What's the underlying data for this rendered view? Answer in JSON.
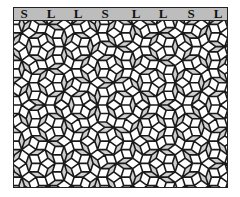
{
  "figure": {
    "type": "penrose-rhombus-tiling",
    "header": {
      "sequence": [
        {
          "letter": "S",
          "x": 10
        },
        {
          "letter": "L",
          "x": 37
        },
        {
          "letter": "L",
          "x": 64
        },
        {
          "letter": "S",
          "x": 91
        },
        {
          "letter": "L",
          "x": 122
        },
        {
          "letter": "L",
          "x": 149
        },
        {
          "letter": "S",
          "x": 177
        },
        {
          "letter": "L",
          "x": 204
        }
      ]
    },
    "colors": {
      "thick_rhombus": "#ffffff",
      "thin_rhombus": "#d0d0d0",
      "edge": "#1a1a1a",
      "header_bg": "#bdbdbd"
    },
    "tiling": {
      "generations": 7,
      "scale": 260,
      "center_x": 107,
      "center_y": 84,
      "rotation_deg": 90,
      "edge_width": 1.6
    }
  }
}
